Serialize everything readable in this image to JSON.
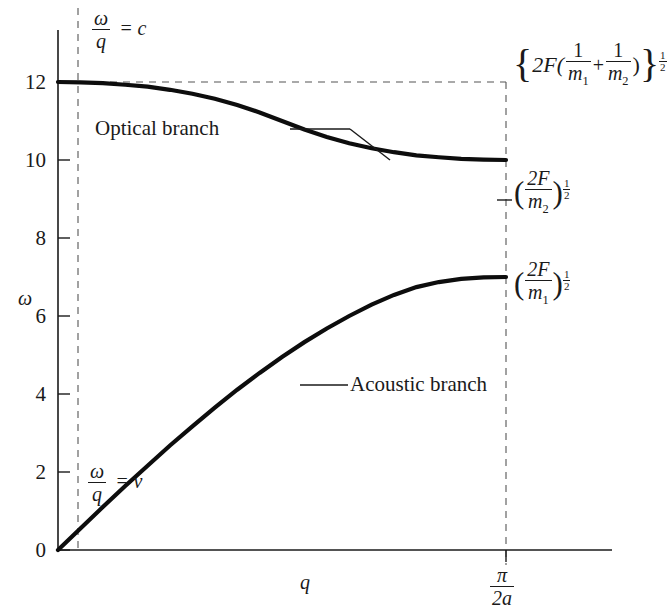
{
  "figure": {
    "axes": {
      "y_axis_label": "ω",
      "x_axis_label": "q",
      "y_ticks": [
        "0",
        "2",
        "4",
        "6",
        "8",
        "10",
        "12"
      ],
      "x_end_tick": {
        "numerator": "π",
        "denominator": "2a"
      }
    },
    "annotations": {
      "optical_branch": "Optical branch",
      "acoustic_branch": "Acoustic branch",
      "slope_c": {
        "num": "ω",
        "den": "q",
        "eq": "= c"
      },
      "slope_v": {
        "num": "ω",
        "den": "q",
        "eq": "= v"
      }
    },
    "right_labels": {
      "top": {
        "open": "{",
        "coef": "2F(",
        "frac1_num": "1",
        "frac1_den": "m",
        "frac1_sub": "1",
        "plus": "+",
        "frac2_num": "1",
        "frac2_den": "m",
        "frac2_sub": "2",
        "close_paren": ")",
        "close": "}",
        "exp_num": "1",
        "exp_den": "2"
      },
      "optical_end": {
        "open": "(",
        "num": "2F",
        "den": "m",
        "sub": "2",
        "close": ")",
        "exp_num": "1",
        "exp_den": "2"
      },
      "acoustic_end": {
        "open": "(",
        "num": "2F",
        "den": "m",
        "sub": "1",
        "close": ")",
        "exp_num": "1",
        "exp_den": "2"
      }
    },
    "colors": {
      "curve": "#0d0d0d",
      "axis": "#1a1a1a",
      "dashed": "#555555",
      "background": "#ffffff"
    }
  },
  "chart_data": {
    "type": "line",
    "xlabel": "q",
    "ylabel": "ω",
    "xlim": [
      0,
      1
    ],
    "ylim": [
      0,
      13.1
    ],
    "x_tick_labels": [
      "π/2a"
    ],
    "x_tick_values": [
      1
    ],
    "y_ticks": [
      0,
      2,
      4,
      6,
      8,
      10,
      12
    ],
    "grid": false,
    "legend": "inline-annotations",
    "series": [
      {
        "name": "Optical branch",
        "comment": "ω from {2F(1/m1+1/m2)}^(1/2) = 12 at q=0 down to (2F/m2)^(1/2) = 10 at q=π/2a",
        "x": [
          0.0,
          0.05,
          0.1,
          0.15,
          0.2,
          0.25,
          0.3,
          0.35,
          0.4,
          0.45,
          0.5,
          0.55,
          0.6,
          0.65,
          0.7,
          0.75,
          0.8,
          0.85,
          0.9,
          0.95,
          1.0
        ],
        "y": [
          12.0,
          11.99,
          11.97,
          11.93,
          11.88,
          11.8,
          11.7,
          11.57,
          11.41,
          11.22,
          11.0,
          10.78,
          10.59,
          10.43,
          10.3,
          10.2,
          10.12,
          10.07,
          10.03,
          10.01,
          10.0
        ]
      },
      {
        "name": "Acoustic branch",
        "comment": "ω from 0 at q=0 rising to (2F/m1)^(1/2) = 7 at q=π/2a",
        "x": [
          0.0,
          0.05,
          0.1,
          0.15,
          0.2,
          0.25,
          0.3,
          0.35,
          0.4,
          0.45,
          0.5,
          0.55,
          0.6,
          0.65,
          0.7,
          0.75,
          0.8,
          0.85,
          0.9,
          0.95,
          1.0
        ],
        "y": [
          0.0,
          0.55,
          1.1,
          1.64,
          2.16,
          2.68,
          3.17,
          3.65,
          4.11,
          4.54,
          4.95,
          5.33,
          5.68,
          6.0,
          6.29,
          6.54,
          6.74,
          6.87,
          6.95,
          6.99,
          7.0
        ]
      }
    ],
    "reference_lines": [
      {
        "name": "omega/q = c",
        "type": "vertical-dashed",
        "x": 0.046
      },
      {
        "name": "zone-boundary",
        "type": "vertical-dashed",
        "x": 1.0
      },
      {
        "name": "omega-max",
        "type": "horizontal-dashed",
        "y": 12.0
      }
    ],
    "endpoint_values": {
      "optical_q0": 12,
      "optical_qmax": 10,
      "acoustic_q0": 0,
      "acoustic_qmax": 7
    }
  }
}
